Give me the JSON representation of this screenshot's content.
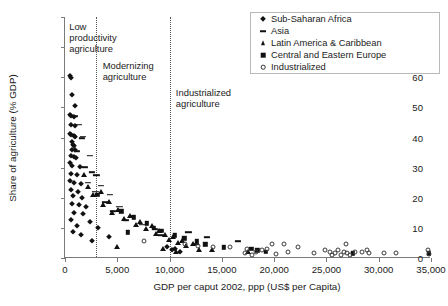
{
  "chart_data": {
    "type": "scatter",
    "title": "",
    "xlabel": "GDP per caput 2002, ppp (US$ per Capita)",
    "ylabel": "Share of agriculture (% GDP)",
    "xlim": [
      0,
      35000
    ],
    "ylim": [
      0,
      80
    ],
    "xticks": [
      0,
      5000,
      10000,
      15000,
      20000,
      25000,
      30000,
      35000
    ],
    "xticklabels": [
      "0",
      "5,000",
      "10,000",
      "15,000",
      "20,000",
      "25,000",
      "30,000",
      "35,000"
    ],
    "yticks": [
      0,
      10,
      20,
      30,
      40,
      50,
      60,
      70,
      80
    ],
    "yticklabels": [
      "0",
      "10",
      "20",
      "30",
      "40",
      "50",
      "60",
      "70",
      "80"
    ],
    "grid": false,
    "legend_position": "top-right",
    "annotations": [
      {
        "name": "low-productivity-agriculture",
        "text": "Low\nproductivity\nagriculture",
        "x": 400,
        "y": 77
      },
      {
        "name": "modernizing-agriculture",
        "text": "Modernizing\nagriculture",
        "x": 3600,
        "y": 64
      },
      {
        "name": "industrialized-agriculture",
        "text": "Industrialized\nagriculture",
        "x": 10600,
        "y": 55
      }
    ],
    "vertical_dividers": [
      {
        "name": "divider-low-modernizing",
        "x": 3000
      },
      {
        "name": "divider-modernizing-industrialized",
        "x": 10000
      }
    ],
    "series": [
      {
        "name": "Sub-Saharan Africa",
        "marker": "diamond",
        "color": "#111111",
        "points": [
          [
            500,
            60.5
          ],
          [
            540,
            59.6
          ],
          [
            700,
            54.0
          ],
          [
            1000,
            50.5
          ],
          [
            520,
            47.5
          ],
          [
            560,
            47.0
          ],
          [
            900,
            46.8
          ],
          [
            620,
            44.0
          ],
          [
            1000,
            43.8
          ],
          [
            520,
            41.0
          ],
          [
            600,
            40.8
          ],
          [
            900,
            40.5
          ],
          [
            1000,
            40.2
          ],
          [
            680,
            38.5
          ],
          [
            800,
            37.5
          ],
          [
            900,
            37.2
          ],
          [
            700,
            36.0
          ],
          [
            1000,
            35.8
          ],
          [
            600,
            34.0
          ],
          [
            850,
            33.5
          ],
          [
            1050,
            33.2
          ],
          [
            500,
            31.5
          ],
          [
            700,
            30.5
          ],
          [
            1450,
            30.3
          ],
          [
            600,
            28.0
          ],
          [
            1100,
            27.5
          ],
          [
            500,
            25.5
          ],
          [
            900,
            25.0
          ],
          [
            1500,
            24.5
          ],
          [
            600,
            22.5
          ],
          [
            1200,
            22.0
          ],
          [
            800,
            20.5
          ],
          [
            1600,
            20.0
          ],
          [
            700,
            18.0
          ],
          [
            1300,
            17.5
          ],
          [
            2000,
            17.0
          ],
          [
            900,
            15.0
          ],
          [
            1700,
            14.5
          ],
          [
            600,
            12.5
          ],
          [
            2400,
            12.0
          ],
          [
            1100,
            10.5
          ],
          [
            3200,
            10.0
          ],
          [
            800,
            8.5
          ],
          [
            1500,
            7.5
          ],
          [
            4200,
            7.0
          ],
          [
            2600,
            5.5
          ],
          [
            9800,
            3.5
          ],
          [
            10200,
            2.5
          ],
          [
            10500,
            3.0
          ],
          [
            11000,
            2.0
          ]
        ]
      },
      {
        "name": "Asia",
        "marker": "dash",
        "color": "#111111",
        "points": [
          [
            900,
            47.0
          ],
          [
            1300,
            44.2
          ],
          [
            1700,
            40.2
          ],
          [
            1600,
            39.8
          ],
          [
            1100,
            35.5
          ],
          [
            2400,
            34.0
          ],
          [
            1900,
            30.2
          ],
          [
            2600,
            28.5
          ],
          [
            3000,
            27.5
          ],
          [
            2200,
            25.0
          ],
          [
            3400,
            24.0
          ],
          [
            2900,
            22.0
          ],
          [
            4300,
            21.0
          ],
          [
            3800,
            18.5
          ],
          [
            5200,
            17.0
          ],
          [
            4600,
            15.5
          ],
          [
            6400,
            14.0
          ],
          [
            5800,
            12.5
          ],
          [
            7400,
            11.0
          ],
          [
            8600,
            9.5
          ],
          [
            11800,
            8.5
          ],
          [
            9200,
            7.5
          ],
          [
            13600,
            7.0
          ],
          [
            16500,
            5.5
          ],
          [
            12500,
            4.5
          ]
        ]
      },
      {
        "name": "Latin America & Caribbean",
        "marker": "triangle",
        "color": "#111111",
        "points": [
          [
            1800,
            27.5
          ],
          [
            2200,
            23.5
          ],
          [
            3400,
            22.0
          ],
          [
            2700,
            21.0
          ],
          [
            4200,
            18.5
          ],
          [
            3600,
            17.5
          ],
          [
            5100,
            16.0
          ],
          [
            4500,
            15.0
          ],
          [
            6200,
            14.0
          ],
          [
            5600,
            13.0
          ],
          [
            7200,
            12.0
          ],
          [
            6800,
            11.0
          ],
          [
            8300,
            10.5
          ],
          [
            7700,
            9.5
          ],
          [
            9000,
            9.0
          ],
          [
            8700,
            8.0
          ],
          [
            9600,
            7.5
          ],
          [
            10300,
            7.0
          ],
          [
            9900,
            6.0
          ],
          [
            11200,
            5.5
          ],
          [
            10800,
            5.0
          ],
          [
            12200,
            4.5
          ],
          [
            11600,
            4.0
          ],
          [
            5000,
            3.5
          ],
          [
            9400,
            3.0
          ],
          [
            12800,
            2.5
          ],
          [
            10600,
            2.0
          ],
          [
            14100,
            2.5
          ],
          [
            17500,
            2.0
          ]
        ]
      },
      {
        "name": "Central and Eastern Europe",
        "marker": "square",
        "color": "#111111",
        "points": [
          [
            3100,
            21.0
          ],
          [
            5400,
            15.5
          ],
          [
            6600,
            13.5
          ],
          [
            7800,
            11.5
          ],
          [
            8500,
            10.0
          ],
          [
            9200,
            9.0
          ],
          [
            6000,
            8.5
          ],
          [
            10500,
            7.5
          ],
          [
            11400,
            6.5
          ],
          [
            12600,
            5.5
          ],
          [
            13400,
            4.5
          ],
          [
            15200,
            3.5
          ],
          [
            17800,
            3.0
          ],
          [
            18400,
            2.5
          ],
          [
            19200,
            2.0
          ],
          [
            27500,
            1.5
          ],
          [
            34800,
            1.5
          ]
        ]
      },
      {
        "name": "Industrialized",
        "marker": "circle",
        "color": "#3a3a3a",
        "points": [
          [
            7600,
            5.5
          ],
          [
            11500,
            4.5
          ],
          [
            12700,
            4.0
          ],
          [
            14200,
            3.5
          ],
          [
            15800,
            3.5
          ],
          [
            17400,
            3.0
          ],
          [
            17200,
            1.5
          ],
          [
            17900,
            1.0
          ],
          [
            18300,
            2.0
          ],
          [
            18800,
            2.5
          ],
          [
            19300,
            3.0
          ],
          [
            19800,
            4.5
          ],
          [
            20900,
            4.5
          ],
          [
            21300,
            2.0
          ],
          [
            22300,
            3.5
          ],
          [
            24900,
            2.5
          ],
          [
            25300,
            2.0
          ],
          [
            25500,
            1.0
          ],
          [
            25800,
            1.5
          ],
          [
            26100,
            2.5
          ],
          [
            26400,
            1.0
          ],
          [
            26700,
            2.0
          ],
          [
            27000,
            1.5
          ],
          [
            26900,
            4.5
          ],
          [
            27300,
            1.0
          ],
          [
            27700,
            2.0
          ],
          [
            28400,
            2.0
          ],
          [
            28900,
            2.5
          ],
          [
            29100,
            1.8
          ],
          [
            30500,
            1.5
          ],
          [
            31700,
            1.5
          ],
          [
            34700,
            2.5
          ],
          [
            34800,
            1.2
          ],
          [
            23800,
            1.5
          ],
          [
            20200,
            1.2
          ]
        ]
      }
    ]
  },
  "legend": {
    "entries": [
      {
        "label": "Sub-Saharan Africa",
        "marker": "diamond"
      },
      {
        "label": "Asia",
        "marker": "dash"
      },
      {
        "label": "Latin America & Caribbean",
        "marker": "triangle"
      },
      {
        "label": "Central and Eastern Europe",
        "marker": "square"
      },
      {
        "label": "Industrialized",
        "marker": "circle"
      }
    ]
  }
}
